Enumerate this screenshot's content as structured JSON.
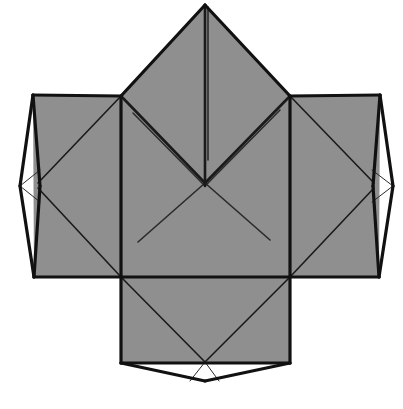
{
  "document": {
    "kind": "origami-crease-pattern-diagram",
    "title": "Origami Crease Pattern",
    "background_color": "#ffffff",
    "width": 403,
    "height": 409
  },
  "palette": {
    "paper_fill": "#8f8f8f",
    "paper_fill_alt": "#929292",
    "flap_fill": "#ffffff",
    "fold_line": "#1a1a1a",
    "outline": "#111111",
    "thin_line": "#2a2a2a",
    "background": "#ffffff"
  },
  "stroke_widths": {
    "outline": 3.2,
    "major_fold": 2.6,
    "minor_fold": 1.6,
    "hairline": 1.0
  },
  "geometry": {
    "center_square": {
      "left": 121,
      "right": 290,
      "top": 96,
      "bottom": 277,
      "center_x": 205.5,
      "center_y": 186.5
    },
    "top_peak": {
      "apex_x": 205,
      "apex_y": 5
    },
    "left_panel": {
      "left": 33,
      "right": 121,
      "top": 95,
      "bottom": 277
    },
    "right_panel": {
      "left": 290,
      "right": 380,
      "top": 95,
      "bottom": 277
    },
    "bottom_panel": {
      "left": 121,
      "right": 290,
      "top": 277,
      "bottom": 363
    },
    "left_flap_tip": {
      "x": 20,
      "y": 186
    },
    "right_flap_tip": {
      "x": 393,
      "y": 186
    },
    "bottom_flap_tip": {
      "x": 205,
      "y": 381
    },
    "x_crossing": {
      "x": 205,
      "y": 183
    }
  },
  "shapes": {
    "top_triangle": {
      "name": "top-peak-triangle",
      "points": "205,5 290,96 121,96",
      "fill": "paper_fill",
      "description": "Large triangular peak above the central square"
    },
    "center_square": {
      "name": "center-square-panel",
      "points": "121,96 290,96 290,277 121,277",
      "fill": "paper_fill",
      "description": "Central square panel of the net"
    },
    "left_panel": {
      "name": "left-side-panel",
      "points": "33,95 121,96 121,277 34,277",
      "fill": "paper_fill",
      "description": "Left rectangular side panel"
    },
    "right_panel": {
      "name": "right-side-panel",
      "points": "290,96 380,95 379,277 290,277",
      "fill": "paper_fill",
      "description": "Right rectangular side panel"
    },
    "bottom_panel": {
      "name": "bottom-panel",
      "points": "121,277 290,277 290,363 121,363",
      "fill": "paper_fill",
      "description": "Bottom rectangular panel"
    },
    "left_flap": {
      "name": "left-white-flap",
      "points": "33,95 20,186 34,277",
      "fill": "flap_fill",
      "description": "Narrow white lens-shaped flap on the left edge"
    },
    "right_flap": {
      "name": "right-white-flap",
      "points": "380,95 393,186 379,277",
      "fill": "flap_fill",
      "description": "Narrow white lens-shaped flap on the right edge"
    },
    "bottom_flap": {
      "name": "bottom-white-flap",
      "points": "121,363 205,381 290,363",
      "fill": "flap_fill",
      "description": "White triangular flap below the bottom panel"
    }
  },
  "fold_lines": {
    "peak_center_crease": {
      "name": "peak-center-crease",
      "from": [
        205,
        7
      ],
      "to": [
        205,
        186
      ],
      "weight": "major_fold"
    },
    "peak_center_crease_b": {
      "name": "peak-center-crease-shadow",
      "from": [
        208,
        7
      ],
      "to": [
        208,
        160
      ],
      "weight": "minor_fold"
    },
    "v_left_arm": {
      "name": "v-fold-left-arm",
      "from": [
        121,
        96
      ],
      "to": [
        205,
        183
      ],
      "weight": "major_fold"
    },
    "v_right_arm": {
      "name": "v-fold-right-arm",
      "from": [
        290,
        96
      ],
      "to": [
        205,
        183
      ],
      "weight": "major_fold"
    },
    "v_left_arm_shadow": {
      "name": "v-fold-left-shadow",
      "from": [
        133,
        113
      ],
      "to": [
        205,
        186
      ],
      "weight": "minor_fold"
    },
    "v_right_arm_shadow": {
      "name": "v-fold-right-shadow",
      "from": [
        280,
        110
      ],
      "to": [
        205,
        186
      ],
      "weight": "minor_fold"
    },
    "x_lower_left": {
      "name": "x-diagonal-lower-left",
      "from": [
        205,
        183
      ],
      "to": [
        138,
        242
      ],
      "weight": "minor_fold"
    },
    "x_lower_right": {
      "name": "x-diagonal-lower-right",
      "from": [
        205,
        183
      ],
      "to": [
        270,
        240
      ],
      "weight": "minor_fold"
    },
    "left_panel_diag_upper": {
      "name": "left-panel-diagonal-upper",
      "from": [
        121,
        96
      ],
      "to": [
        38,
        183
      ],
      "weight": "minor_fold"
    },
    "left_panel_diag_lower": {
      "name": "left-panel-diagonal-lower",
      "from": [
        38,
        188
      ],
      "to": [
        121,
        277
      ],
      "weight": "minor_fold"
    },
    "right_panel_diag_upper": {
      "name": "right-panel-diagonal-upper",
      "from": [
        290,
        96
      ],
      "to": [
        374,
        183
      ],
      "weight": "minor_fold"
    },
    "right_panel_diag_lower": {
      "name": "right-panel-diagonal-lower",
      "from": [
        374,
        188
      ],
      "to": [
        290,
        277
      ],
      "weight": "minor_fold"
    },
    "bottom_diag_left": {
      "name": "bottom-panel-diagonal-left",
      "from": [
        121,
        277
      ],
      "to": [
        205,
        362
      ],
      "weight": "minor_fold"
    },
    "bottom_diag_right": {
      "name": "bottom-panel-diagonal-right",
      "from": [
        290,
        277
      ],
      "to": [
        205,
        362
      ],
      "weight": "minor_fold"
    },
    "bottom_flap_left_crease": {
      "name": "bottom-flap-left-crease",
      "from": [
        205,
        362
      ],
      "to": [
        190,
        381
      ],
      "weight": "hairline"
    },
    "bottom_flap_right_crease": {
      "name": "bottom-flap-right-crease",
      "from": [
        205,
        362
      ],
      "to": [
        219,
        381
      ],
      "weight": "hairline"
    },
    "left_flap_upper_crease": {
      "name": "left-flap-upper-crease",
      "from": [
        20,
        186
      ],
      "to": [
        40,
        170
      ],
      "weight": "hairline"
    },
    "left_flap_lower_crease": {
      "name": "left-flap-lower-crease",
      "from": [
        20,
        186
      ],
      "to": [
        40,
        202
      ],
      "weight": "hairline"
    },
    "right_flap_upper_crease": {
      "name": "right-flap-upper-crease",
      "from": [
        393,
        186
      ],
      "to": [
        372,
        170
      ],
      "weight": "hairline"
    },
    "right_flap_lower_crease": {
      "name": "right-flap-lower-crease",
      "from": [
        393,
        186
      ],
      "to": [
        372,
        202
      ],
      "weight": "hairline"
    }
  },
  "outlines": {
    "center_left_edge": {
      "name": "center-square-left-edge",
      "from": [
        121,
        96
      ],
      "to": [
        121,
        277
      ]
    },
    "center_right_edge": {
      "name": "center-square-right-edge",
      "from": [
        290,
        96
      ],
      "to": [
        290,
        277
      ]
    },
    "center_bottom_edge": {
      "name": "center-square-bottom-edge",
      "from": [
        34,
        277
      ],
      "to": [
        379,
        277
      ]
    },
    "peak_left_edge": {
      "name": "peak-left-edge",
      "from": [
        205,
        5
      ],
      "to": [
        121,
        96
      ]
    },
    "peak_right_edge": {
      "name": "peak-right-edge",
      "from": [
        205,
        5
      ],
      "to": [
        290,
        96
      ]
    },
    "left_panel_top": {
      "name": "left-panel-top-edge",
      "from": [
        33,
        95
      ],
      "to": [
        121,
        96
      ]
    },
    "right_panel_top": {
      "name": "right-panel-top-edge",
      "from": [
        290,
        96
      ],
      "to": [
        380,
        95
      ]
    },
    "left_flap_outer_upper": {
      "name": "left-flap-outer-upper-edge",
      "from": [
        33,
        95
      ],
      "to": [
        20,
        186
      ]
    },
    "left_flap_outer_lower": {
      "name": "left-flap-outer-lower-edge",
      "from": [
        20,
        186
      ],
      "to": [
        34,
        277
      ]
    },
    "left_flap_inner_upper": {
      "name": "left-flap-inner-upper-edge",
      "from": [
        33,
        95
      ],
      "to": [
        40,
        186
      ]
    },
    "left_flap_inner_lower": {
      "name": "left-flap-inner-lower-edge",
      "from": [
        40,
        186
      ],
      "to": [
        34,
        277
      ]
    },
    "right_flap_outer_upper": {
      "name": "right-flap-outer-upper-edge",
      "from": [
        380,
        95
      ],
      "to": [
        393,
        186
      ]
    },
    "right_flap_outer_lower": {
      "name": "right-flap-outer-lower-edge",
      "from": [
        393,
        186
      ],
      "to": [
        379,
        277
      ]
    },
    "right_flap_inner_upper": {
      "name": "right-flap-inner-upper-edge",
      "from": [
        380,
        95
      ],
      "to": [
        373,
        186
      ]
    },
    "right_flap_inner_lower": {
      "name": "right-flap-inner-lower-edge",
      "from": [
        373,
        186
      ],
      "to": [
        379,
        277
      ]
    },
    "bottom_panel_left_edge": {
      "name": "bottom-panel-left-edge",
      "from": [
        121,
        277
      ],
      "to": [
        121,
        363
      ]
    },
    "bottom_panel_right_edge": {
      "name": "bottom-panel-right-edge",
      "from": [
        290,
        277
      ],
      "to": [
        290,
        363
      ]
    },
    "bottom_panel_bottom_edge": {
      "name": "bottom-panel-bottom-edge",
      "from": [
        121,
        363
      ],
      "to": [
        290,
        363
      ]
    },
    "bottom_flap_left_edge": {
      "name": "bottom-flap-left-edge",
      "from": [
        121,
        363
      ],
      "to": [
        205,
        381
      ]
    },
    "bottom_flap_right_edge": {
      "name": "bottom-flap-right-edge",
      "from": [
        205,
        381
      ],
      "to": [
        290,
        363
      ]
    }
  },
  "labels": {
    "figure_caption": "",
    "annotations": []
  }
}
